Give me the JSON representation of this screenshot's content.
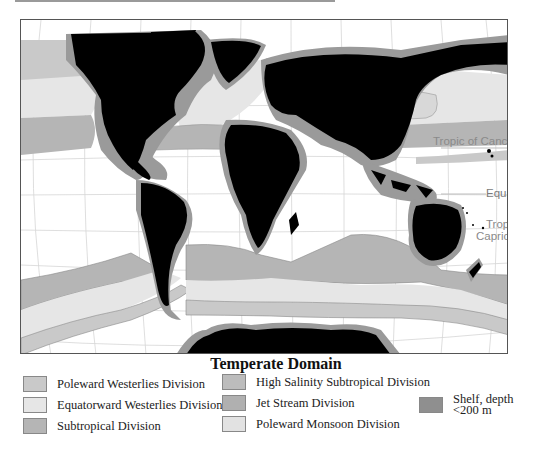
{
  "map": {
    "type": "world ocean ecoregions map",
    "labels": {
      "tropic_cancer": "Tropic of Cancer",
      "equator": "Equator",
      "tropic_capricorn_line1": "Tropic of",
      "tropic_capricorn_line2": "Capricorn"
    },
    "colors": {
      "land": "#000000",
      "ocean": "#ffffff",
      "graticule": "#d0d0d0",
      "poleward_westerlies": "#c9c9c9",
      "equatorward_westerlies": "#e6e6e6",
      "subtropical": "#b5b5b5",
      "high_salinity_subtropical": "#bcbcbc",
      "jet_stream": "#b0b0b0",
      "poleward_monsoon": "#e2e2e2",
      "shelf": "#8f8f8f"
    }
  },
  "legend": {
    "title": "Temperate Domain",
    "items": [
      {
        "label": "Poleward Westerlies Division",
        "color": "#c9c9c9"
      },
      {
        "label": "Equatorward Westerlies Division",
        "color": "#e6e6e6"
      },
      {
        "label": "Subtropical Division",
        "color": "#b5b5b5"
      },
      {
        "label": "High Salinity Subtropical Division",
        "color": "#bcbcbc"
      },
      {
        "label": "Jet Stream Division",
        "color": "#b0b0b0"
      },
      {
        "label": "Poleward Monsoon Division",
        "color": "#e2e2e2"
      }
    ],
    "shelf": {
      "line1": "Shelf, depth",
      "line2": "<200 m",
      "color": "#8f8f8f"
    }
  }
}
